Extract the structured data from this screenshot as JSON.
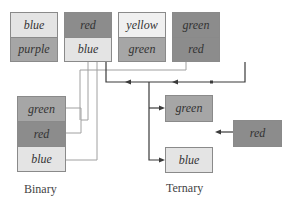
{
  "top_row": [
    {
      "top": "blue",
      "bottom": "purple"
    },
    {
      "top": "red",
      "bottom": "blue"
    },
    {
      "top": "yellow",
      "bottom": "green"
    },
    {
      "top": "green",
      "bottom": "red"
    }
  ],
  "binary": {
    "items": [
      "green",
      "red",
      "blue"
    ],
    "caption": "Binary"
  },
  "ternary": {
    "items": [
      "green",
      "blue"
    ],
    "input": "red",
    "caption": "Ternary"
  },
  "colors": {
    "light_cell": "#e4e4e4",
    "mid_cell": "#a6a6a6",
    "dark_cell": "#8c8c8c",
    "line_light": "#9a9a9a",
    "line_dark": "#333333"
  }
}
